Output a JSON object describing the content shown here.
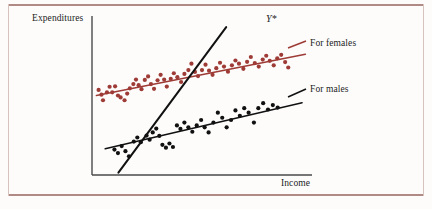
{
  "figure": {
    "background": "#fdfcfb",
    "border_color": "#b08a84"
  },
  "labels": {
    "ylabel": "Expenditures",
    "xlabel": "Income",
    "females": "For females",
    "males": "For males",
    "pooled": "Y*"
  },
  "chart_data": {
    "type": "scatter",
    "title": "",
    "xlabel": "Income",
    "ylabel": "Expenditures",
    "grid": false,
    "legend_position": "right-inline",
    "axis": {
      "x_range_px": [
        92,
        312
      ],
      "y_range_px": [
        16,
        175
      ],
      "ticks": false,
      "tick_labels": []
    },
    "colors": {
      "females": "#9e3b36",
      "males": "#111111",
      "pooled_line": "#111111"
    },
    "series": [
      {
        "name": "For females",
        "color": "#9e3b36",
        "marker": "circle",
        "points": [
          [
            0.03,
            0.535
          ],
          [
            0.043,
            0.505
          ],
          [
            0.05,
            0.47
          ],
          [
            0.068,
            0.52
          ],
          [
            0.08,
            0.555
          ],
          [
            0.092,
            0.52
          ],
          [
            0.105,
            0.558
          ],
          [
            0.118,
            0.5
          ],
          [
            0.13,
            0.488
          ],
          [
            0.148,
            0.47
          ],
          [
            0.16,
            0.512
          ],
          [
            0.172,
            0.545
          ],
          [
            0.188,
            0.572
          ],
          [
            0.2,
            0.6
          ],
          [
            0.212,
            0.565
          ],
          [
            0.225,
            0.54
          ],
          [
            0.24,
            0.598
          ],
          [
            0.255,
            0.62
          ],
          [
            0.268,
            0.572
          ],
          [
            0.282,
            0.542
          ],
          [
            0.298,
            0.596
          ],
          [
            0.312,
            0.63
          ],
          [
            0.328,
            0.6
          ],
          [
            0.34,
            0.556
          ],
          [
            0.358,
            0.605
          ],
          [
            0.372,
            0.64
          ],
          [
            0.388,
            0.615
          ],
          [
            0.405,
            0.585
          ],
          [
            0.42,
            0.636
          ],
          [
            0.438,
            0.66
          ],
          [
            0.452,
            0.7
          ],
          [
            0.468,
            0.648
          ],
          [
            0.482,
            0.622
          ],
          [
            0.5,
            0.66
          ],
          [
            0.516,
            0.694
          ],
          [
            0.532,
            0.656
          ],
          [
            0.548,
            0.63
          ],
          [
            0.565,
            0.672
          ],
          [
            0.582,
            0.706
          ],
          [
            0.6,
            0.682
          ],
          [
            0.618,
            0.65
          ],
          [
            0.636,
            0.69
          ],
          [
            0.652,
            0.72
          ],
          [
            0.668,
            0.7
          ],
          [
            0.688,
            0.668
          ],
          [
            0.705,
            0.712
          ],
          [
            0.722,
            0.742
          ],
          [
            0.74,
            0.704
          ],
          [
            0.758,
            0.682
          ],
          [
            0.776,
            0.726
          ],
          [
            0.792,
            0.75
          ],
          [
            0.808,
            0.718
          ],
          [
            0.826,
            0.69
          ],
          [
            0.842,
            0.734
          ],
          [
            0.86,
            0.756
          ],
          [
            0.878,
            0.71
          ],
          [
            0.892,
            0.676
          ]
        ],
        "fit_line": {
          "x0": 0.02,
          "y0": 0.5,
          "x1": 0.97,
          "y1": 0.76
        }
      },
      {
        "name": "For males",
        "color": "#111111",
        "marker": "circle",
        "points": [
          [
            0.102,
            0.16
          ],
          [
            0.118,
            0.138
          ],
          [
            0.135,
            0.182
          ],
          [
            0.152,
            0.15
          ],
          [
            0.168,
            0.118
          ],
          [
            0.19,
            0.21
          ],
          [
            0.206,
            0.236
          ],
          [
            0.222,
            0.206
          ],
          [
            0.248,
            0.248
          ],
          [
            0.262,
            0.222
          ],
          [
            0.276,
            0.268
          ],
          [
            0.292,
            0.292
          ],
          [
            0.306,
            0.246
          ],
          [
            0.32,
            0.19
          ],
          [
            0.336,
            0.172
          ],
          [
            0.352,
            0.198
          ],
          [
            0.368,
            0.176
          ],
          [
            0.386,
            0.312
          ],
          [
            0.402,
            0.29
          ],
          [
            0.42,
            0.33
          ],
          [
            0.438,
            0.3
          ],
          [
            0.456,
            0.272
          ],
          [
            0.476,
            0.312
          ],
          [
            0.496,
            0.346
          ],
          [
            0.512,
            0.3
          ],
          [
            0.53,
            0.268
          ],
          [
            0.552,
            0.33
          ],
          [
            0.572,
            0.392
          ],
          [
            0.592,
            0.36
          ],
          [
            0.612,
            0.3
          ],
          [
            0.632,
            0.346
          ],
          [
            0.652,
            0.406
          ],
          [
            0.672,
            0.372
          ],
          [
            0.692,
            0.42
          ],
          [
            0.712,
            0.392
          ],
          [
            0.736,
            0.33
          ],
          [
            0.756,
            0.42
          ],
          [
            0.778,
            0.452
          ],
          [
            0.8,
            0.412
          ],
          [
            0.822,
            0.44
          ],
          [
            0.844,
            0.424
          ]
        ],
        "fit_line": {
          "x0": 0.06,
          "y0": 0.165,
          "x1": 0.955,
          "y1": 0.455
        }
      },
      {
        "name": "Y*",
        "color": "#111111",
        "marker": "none",
        "points": [],
        "fit_line": {
          "x0": 0.12,
          "y0": 0.015,
          "x1": 0.61,
          "y1": 0.93
        }
      }
    ]
  }
}
